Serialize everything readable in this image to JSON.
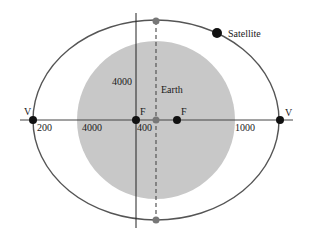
{
  "diagram": {
    "colors": {
      "orbit": "#555555",
      "earth": "#c8c8c8",
      "axis": "#444444",
      "point": "#111111",
      "center_point": "#777777"
    },
    "labels": {
      "satellite": "Satellite",
      "earth": "Earth",
      "vertex_left": "V",
      "vertex_right": "V",
      "focus_left": "F",
      "focus_right": "F",
      "dist_left_perigee": "200",
      "earth_radius_horizontal": "4000",
      "earth_radius_vertical": "4000",
      "focus_offset": "400",
      "dist_right_apogee": "1000"
    },
    "geometry": {
      "orbit_ellipse": {
        "cx": 156,
        "cy": 120,
        "rx": 123,
        "ry": 100
      },
      "earth_circle": {
        "cx": 156,
        "cy": 120,
        "r": 79
      },
      "foci_x": [
        136,
        177
      ],
      "vertices_x": [
        33,
        280
      ]
    }
  }
}
